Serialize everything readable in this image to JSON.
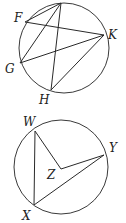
{
  "figures": [
    {
      "id": "figure-1",
      "circle": {
        "cx": 64,
        "cy": 48,
        "r": 45
      },
      "points": [
        {
          "name": "T",
          "label": "",
          "x": 61,
          "y": 3
        },
        {
          "name": "F",
          "label": "F",
          "x": 25,
          "y": 22,
          "lx": 14,
          "ly": 22
        },
        {
          "name": "K",
          "label": "K",
          "x": 104,
          "y": 35,
          "lx": 108,
          "ly": 39
        },
        {
          "name": "G",
          "label": "G",
          "x": 20,
          "y": 63,
          "lx": 5,
          "ly": 73
        },
        {
          "name": "H",
          "label": "H",
          "x": 51,
          "y": 90,
          "lx": 39,
          "ly": 104
        }
      ],
      "segments": [
        [
          "T",
          "F"
        ],
        [
          "T",
          "G"
        ],
        [
          "T",
          "H"
        ],
        [
          "F",
          "K"
        ],
        [
          "G",
          "K"
        ],
        [
          "H",
          "K"
        ]
      ]
    },
    {
      "id": "figure-2",
      "circle": {
        "cx": 61,
        "cy": 167,
        "r": 47
      },
      "points": [
        {
          "name": "W",
          "label": "W",
          "x": 35,
          "y": 131,
          "lx": 23,
          "ly": 126
        },
        {
          "name": "Y",
          "label": "Y",
          "x": 104,
          "y": 155,
          "lx": 109,
          "ly": 152
        },
        {
          "name": "Z",
          "label": "Z",
          "x": 61,
          "y": 169,
          "lx": 47,
          "ly": 179
        },
        {
          "name": "X",
          "label": "X",
          "x": 34,
          "y": 205,
          "lx": 22,
          "ly": 220
        }
      ],
      "segments": [
        [
          "W",
          "X"
        ],
        [
          "W",
          "Z"
        ],
        [
          "Z",
          "Y"
        ],
        [
          "X",
          "Y"
        ]
      ]
    }
  ],
  "colors": {
    "stroke": "#2a2a2a",
    "label": "#222222",
    "background": "#ffffff"
  }
}
